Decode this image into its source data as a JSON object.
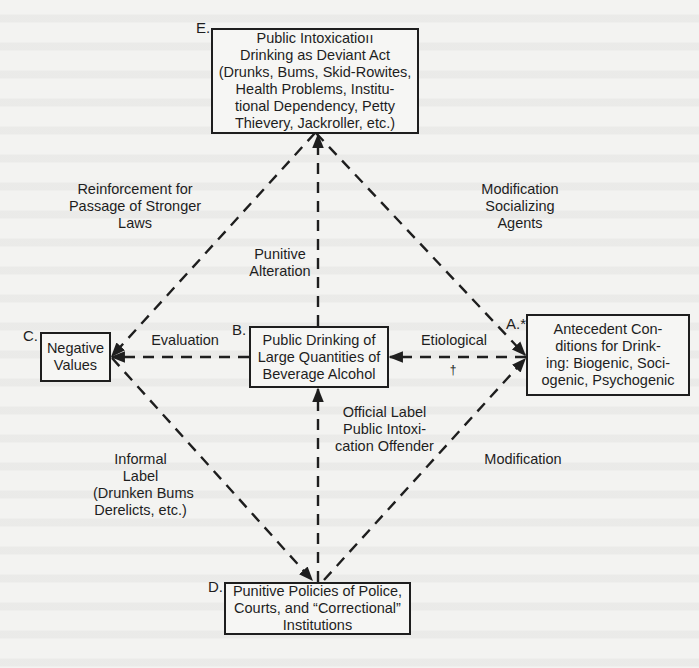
{
  "nodes": {
    "E": {
      "letter": "E.",
      "lines": [
        "Public Intoxicatioıı",
        "Drinking as Deviant Act",
        "(Drunks, Bums, Skid-Rowites,",
        "Health Problems, Institu-",
        "tional Dependency, Petty",
        "Thievery, Jackroller, etc.)"
      ]
    },
    "C": {
      "letter": "C.",
      "lines": [
        "Negative",
        "Values"
      ]
    },
    "B": {
      "letter": "B.",
      "lines": [
        "Public Drinking of",
        "Large Quantities of",
        "Beverage Alcohol"
      ]
    },
    "A": {
      "letter": "A.*",
      "lines": [
        "Antecedent Con-",
        "ditions for Drink-",
        "ing: Biogenic, Soci-",
        "ogenic, Psychogenic"
      ]
    },
    "D": {
      "letter": "D.",
      "lines": [
        "Punitive Policies of Police,",
        "Courts, and “Correctional”",
        "Institutions"
      ]
    }
  },
  "edge_labels": {
    "reinforcement": [
      "Reinforcement for",
      "Passage of Stronger",
      "Laws"
    ],
    "modification_socializing": [
      "Modification",
      "Socializing",
      "Agents"
    ],
    "punitive_alteration": [
      "Punitive",
      "Alteration"
    ],
    "evaluation": [
      "Evaluation"
    ],
    "etiological": [
      "Etiological"
    ],
    "dagger": "†",
    "official_label": [
      "Official Label",
      "Public Intoxi-",
      "cation Offender"
    ],
    "informal_label": [
      "Informal",
      "Label",
      "(Drunken Bums",
      "Derelicts, etc.)"
    ],
    "modification": [
      "Modification"
    ]
  },
  "edges": [
    {
      "from": "A",
      "to": "B",
      "label": "Etiological",
      "style": "dashed"
    },
    {
      "from": "B",
      "to": "C",
      "label": "Evaluation",
      "style": "dashed"
    },
    {
      "from": "B",
      "to": "E",
      "label": "Punitive Alteration",
      "style": "dashed"
    },
    {
      "from": "D",
      "to": "B",
      "label": "Official Label Public Intoxication Offender",
      "style": "dashed"
    },
    {
      "from": "E",
      "to": "C",
      "label": "Reinforcement for Passage of Stronger Laws",
      "style": "dashed"
    },
    {
      "from": "E",
      "to": "A",
      "label": "Modification Socializing Agents",
      "style": "dashed"
    },
    {
      "from": "C",
      "to": "D",
      "label": "Informal Label (Drunken Bums Derelicts, etc.)",
      "style": "dashed"
    },
    {
      "from": "D",
      "to": "A",
      "label": "Modification",
      "style": "dashed"
    }
  ],
  "colors": {
    "ink": "#1e1e1e",
    "paper": "#f3f3f1"
  }
}
